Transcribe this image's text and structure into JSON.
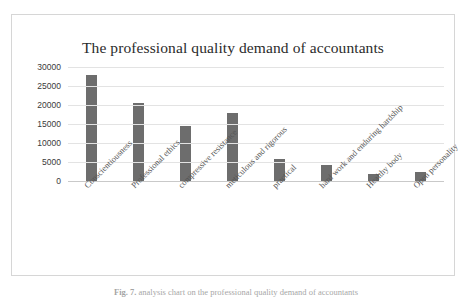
{
  "figure": {
    "caption_label": "Fig. 7.",
    "caption_text": "  analysis chart on the professional quality demand of accountants"
  },
  "chart_data": {
    "type": "bar",
    "title": "The professional quality demand of accountants",
    "xlabel": "",
    "ylabel": "",
    "ylim": [
      0,
      30000
    ],
    "yticks": [
      30000,
      25000,
      20000,
      15000,
      10000,
      5000,
      0
    ],
    "ytick_labels": [
      "30000",
      "25000",
      "20000",
      "15000",
      "10000",
      "5000",
      "0"
    ],
    "grid": true,
    "legend": "none",
    "bar_color": "#6d6d6d",
    "categories": [
      "Conscientiousness",
      "Professional ethics",
      "compressive resistance",
      "meticulous and rigorous",
      "practical",
      "hard work and enduring hardship",
      "Healthy body",
      "Open personality"
    ],
    "values": [
      28000,
      20500,
      14500,
      18000,
      5700,
      4300,
      1900,
      2500
    ]
  }
}
